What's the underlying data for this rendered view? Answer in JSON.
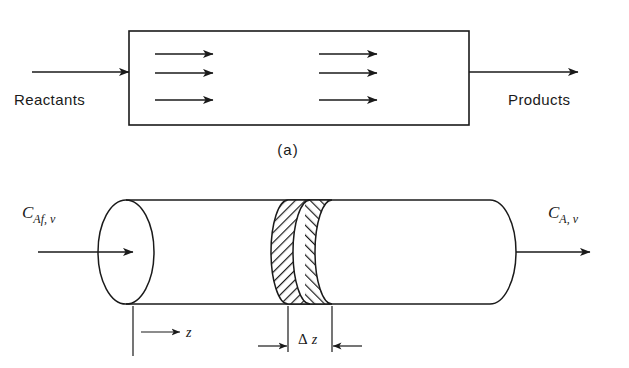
{
  "figure": {
    "line_color": "#1a1a1a",
    "background_color": "#ffffff"
  },
  "panel_a": {
    "caption": "(a)",
    "inlet_label": "Reactants",
    "outlet_label": "Products",
    "flow_arrow_count": 6,
    "arrow_rows": 3,
    "arrow_columns": 2
  },
  "panel_b": {
    "inlet_concentration": "C",
    "inlet_concentration_subscript": "Af, v",
    "outlet_concentration": "C",
    "outlet_concentration_subscript": "A, v",
    "axial_coordinate": "z",
    "delta_symbol": "Δ",
    "delta_length": "z",
    "element_label": "Δ z",
    "hatched_element": "differential-volume-slice"
  }
}
